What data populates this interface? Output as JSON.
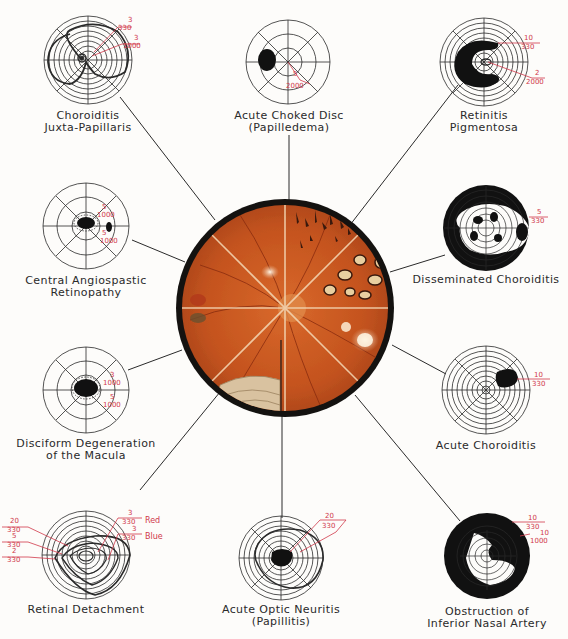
{
  "center_image": {
    "name": "fundus-composite",
    "description": "Circular composite fundus painting divided into 8 sectors",
    "border_color": "#111111",
    "fundus_color": "#c4541f"
  },
  "colors": {
    "background": "#fdfcfa",
    "line": "#2a2a2a",
    "annotation_red": "#d0384a"
  },
  "diagrams": [
    {
      "id": "choroiditis-juxta-papillaris",
      "label_lines": [
        "Choroiditis",
        "Juxta-Papillaris"
      ],
      "annotations": [
        {
          "num": "3",
          "den": "330"
        },
        {
          "num": "3",
          "den": "1000"
        }
      ]
    },
    {
      "id": "acute-choked-disc",
      "label_lines": [
        "Acute Choked Disc",
        "(Papilledema)"
      ],
      "annotations": [
        {
          "num": "5",
          "den": "2000"
        }
      ]
    },
    {
      "id": "retinitis-pigmentosa",
      "label_lines": [
        "Retinitis",
        "Pigmentosa"
      ],
      "annotations": [
        {
          "num": "10",
          "den": "330"
        },
        {
          "num": "2",
          "den": "2000"
        }
      ]
    },
    {
      "id": "central-angiospastic-retinopathy",
      "label_lines": [
        "Central Angiospastic",
        "Retinopathy"
      ],
      "annotations": [
        {
          "num": "5",
          "den": "1000"
        },
        {
          "num": "5",
          "den": "1000"
        }
      ]
    },
    {
      "id": "disseminated-choroiditis",
      "label_lines": [
        "Disseminated Choroiditis"
      ],
      "annotations": [
        {
          "num": "5",
          "den": "330"
        }
      ]
    },
    {
      "id": "disciform-degeneration",
      "label_lines": [
        "Disciform Degeneration",
        "of the Macula"
      ],
      "annotations": [
        {
          "num": "3",
          "den": "1000"
        },
        {
          "num": "5",
          "den": "1000"
        }
      ]
    },
    {
      "id": "acute-choroiditis",
      "label_lines": [
        "Acute Choroiditis"
      ],
      "annotations": [
        {
          "num": "10",
          "den": "330"
        }
      ]
    },
    {
      "id": "retinal-detachment",
      "label_lines": [
        "Retinal Detachment"
      ],
      "annotations": [
        {
          "num": "20",
          "den": "330"
        },
        {
          "num": "5",
          "den": "330"
        },
        {
          "num": "2",
          "den": "330"
        },
        {
          "num": "3",
          "den": "330",
          "color_label": "Red"
        },
        {
          "num": "3",
          "den": "330",
          "color_label": "Blue"
        }
      ]
    },
    {
      "id": "acute-optic-neuritis",
      "label_lines": [
        "Acute Optic Neuritis",
        "(Papillitis)"
      ],
      "annotations": [
        {
          "num": "20",
          "den": "330"
        }
      ]
    },
    {
      "id": "obstruction-inferior-nasal-artery",
      "label_lines": [
        "Obstruction of",
        "Inferior Nasal Artery"
      ],
      "annotations": [
        {
          "num": "10",
          "den": "330"
        },
        {
          "num": "10",
          "den": "1000"
        }
      ]
    }
  ]
}
